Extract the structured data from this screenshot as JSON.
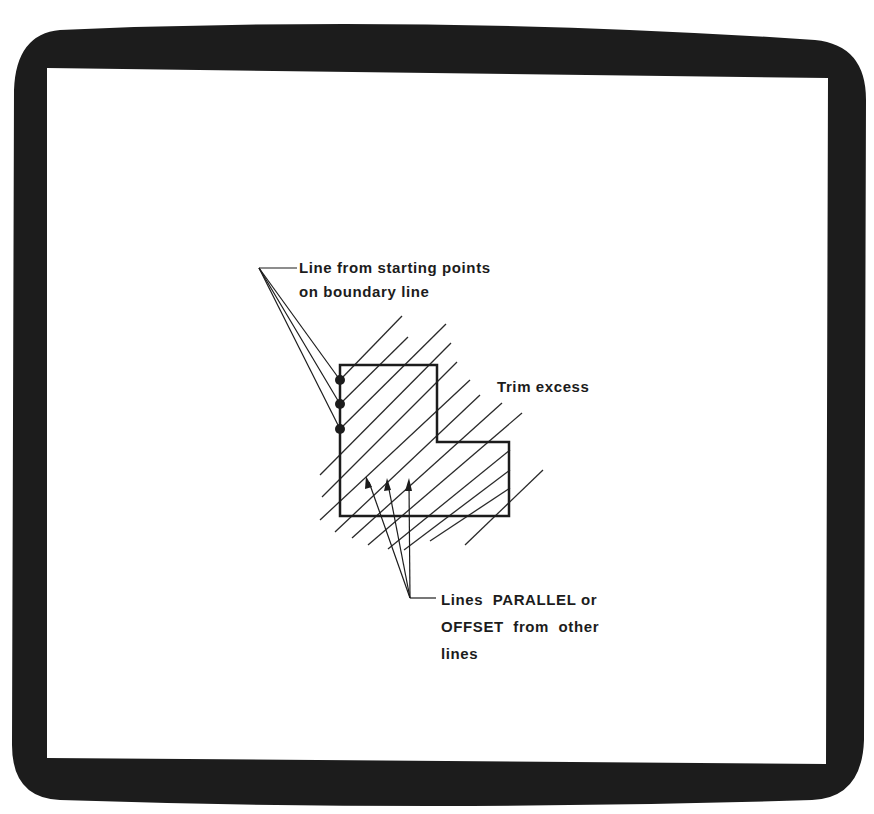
{
  "diagram": {
    "colors": {
      "frame": "#1c1c1c",
      "screen": "#ffffff",
      "ink": "#1c1c1c"
    },
    "labels": {
      "starting_points": {
        "line1": "Line from starting points",
        "line2": "on boundary line"
      },
      "trim": "Trim excess",
      "parallel": {
        "line1": "Lines  PARALLEL or",
        "line2": "OFFSET  from  other",
        "line3": "lines"
      }
    },
    "icons": {
      "starting-point-marker": "filled-circle",
      "arrowhead": "triangle"
    }
  }
}
